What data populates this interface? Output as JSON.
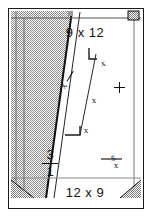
{
  "drawing": {
    "title_top": "9 x 12",
    "title_bottom": "12 x 9",
    "fraction": {
      "numerator": "3",
      "denominator": "1"
    },
    "side_glyph": "s",
    "marks": {
      "plus": "+",
      "x": "x"
    },
    "colors": {
      "ink": "#111111",
      "frame": "#1a1a1a",
      "hatch_fill": "#b9b9b9",
      "paper": "#ffffff"
    },
    "x_marks": [
      {
        "id": "x-mark-upper",
        "label": "x"
      },
      {
        "id": "x-mark-middle",
        "label": "x"
      },
      {
        "id": "x-mark-lower",
        "label": "x"
      },
      {
        "id": "x-mark-diagonal",
        "label": "x"
      },
      {
        "id": "x-mark-sglyph",
        "label": "x"
      }
    ],
    "annotations": {
      "diagonal_note": "x",
      "top_bracket": "corner-bracket",
      "bottom_bracket": "corner-bracket"
    }
  }
}
